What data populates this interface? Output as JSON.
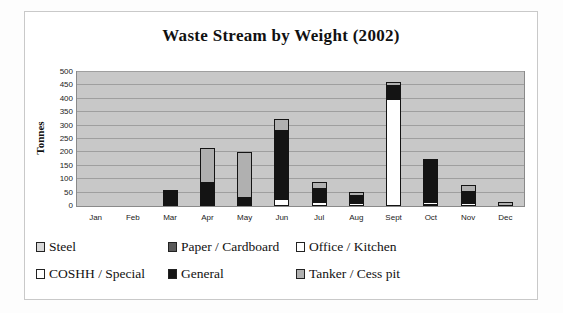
{
  "chart_data": {
    "type": "bar",
    "stacked": true,
    "title": "Waste Stream by Weight (2002)",
    "ylabel": "Tonnes",
    "xlabel": "",
    "ylim": [
      0,
      500
    ],
    "y_ticks": [
      0,
      50,
      100,
      150,
      200,
      250,
      300,
      350,
      400,
      450,
      500
    ],
    "grid": true,
    "legend_position": "bottom",
    "plot_bg_color": "#c8c8c8",
    "gridline_color": "#9f9f9f",
    "categories": [
      "Jan",
      "Feb",
      "Mar",
      "Apr",
      "May",
      "Jun",
      "Jul",
      "Aug",
      "Sept",
      "Oct",
      "Nov",
      "Dec"
    ],
    "series": [
      {
        "name": "Steel",
        "color": "#d8d8d8",
        "values": [
          0,
          0,
          0,
          0,
          0,
          0,
          0,
          0,
          0,
          5,
          0,
          0
        ]
      },
      {
        "name": "Paper / Cardboard",
        "color": "#5a5a5a",
        "values": [
          0,
          0,
          0,
          0,
          0,
          0,
          0,
          0,
          0,
          0,
          0,
          0
        ]
      },
      {
        "name": "Office / Kitchen",
        "color": "#ffffff",
        "values": [
          0,
          0,
          0,
          0,
          0,
          25,
          15,
          10,
          0,
          10,
          10,
          0
        ]
      },
      {
        "name": "COSHH / Special",
        "color": "#ffffff",
        "values": [
          0,
          0,
          0,
          0,
          0,
          0,
          0,
          0,
          400,
          0,
          0,
          0
        ]
      },
      {
        "name": "General",
        "color": "#141414",
        "values": [
          0,
          0,
          60,
          90,
          35,
          260,
          55,
          35,
          55,
          165,
          50,
          0
        ]
      },
      {
        "name": "Tanker / Cess pit",
        "color": "#b0b0b0",
        "values": [
          0,
          0,
          0,
          130,
          170,
          45,
          25,
          15,
          15,
          0,
          25,
          15
        ]
      }
    ],
    "totals": [
      0,
      0,
      60,
      220,
      205,
      330,
      95,
      60,
      470,
      180,
      85,
      15
    ]
  }
}
